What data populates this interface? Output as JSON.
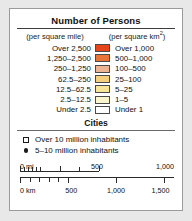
{
  "legend": {
    "title": "Number of Persons",
    "units": {
      "left": "(per square mile)",
      "right_prefix": "(per square km",
      "right_sup": "2",
      "right_suffix": ")"
    },
    "density_rows": [
      {
        "miles": "Over 2,500",
        "km": "Over 1,000",
        "color": "#e8441c"
      },
      {
        "miles": "1,250–2,500",
        "km": "500–1,000",
        "color": "#e8743a"
      },
      {
        "miles": "250–1,250",
        "km": "100–500",
        "color": "#eeb595"
      },
      {
        "miles": "62.5–250",
        "km": "25–100",
        "color": "#f3cf7e"
      },
      {
        "miles": "12.5–62.5",
        "km": "5–25",
        "color": "#f7e59a"
      },
      {
        "miles": "2.5–12.5",
        "km": "1–5",
        "color": "#fcf6cf"
      },
      {
        "miles": "Under 2.5",
        "km": "Under 1",
        "color": "#ffffff"
      }
    ],
    "cities": {
      "heading": "Cities",
      "items": [
        {
          "marker": "square-marker",
          "label": "Over 10 million inhabitants"
        },
        {
          "marker": "circle-marker",
          "label": "5–10 million inhabitants"
        }
      ]
    },
    "scale": {
      "miles_unit": "0 mi",
      "miles_ticks": [
        "500",
        "1,000"
      ],
      "km_unit": "0 km",
      "km_ticks": [
        "500",
        "1,000",
        "1,500"
      ]
    }
  }
}
